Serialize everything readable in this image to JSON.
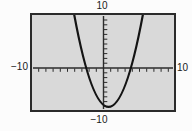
{
  "figure": {
    "labels": {
      "top": "10",
      "bottom": "−10",
      "left": "−10",
      "right": "10"
    }
  },
  "chart_data": {
    "type": "line",
    "xlabel": "",
    "ylabel": "",
    "window": {
      "xmin": -10,
      "xmax": 10,
      "xscl": 1,
      "ymin": -10,
      "ymax": 10,
      "yscl": 1
    },
    "axis_tick_labels": {
      "x": [
        "-10",
        "10"
      ],
      "y": [
        "10",
        "-10"
      ]
    },
    "grid": false,
    "legend": false,
    "series": [
      {
        "name": "parabola",
        "shape": "upward-opening parabola",
        "vertex": [
          0.7,
          -8.1
        ],
        "x_intercepts": [
          -2.4,
          3.8
        ],
        "points": [
          [
            -4,
            10.5
          ],
          [
            -3,
            3.4
          ],
          [
            -2,
            -2.0
          ],
          [
            -1,
            -5.7
          ],
          [
            0,
            -7.7
          ],
          [
            1,
            -8.0
          ],
          [
            2,
            -6.7
          ],
          [
            3,
            -3.7
          ],
          [
            4,
            1.0
          ],
          [
            5,
            7.4
          ]
        ],
        "color": "#141414"
      }
    ],
    "colors": {
      "screen_fill": "#d9d9d9",
      "screen_border": "#2b2b2b",
      "axis": "#2b2b2b",
      "background": "#fcfcfc"
    }
  }
}
